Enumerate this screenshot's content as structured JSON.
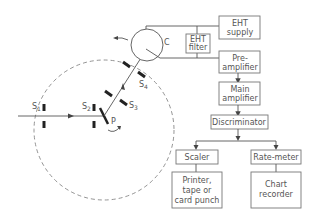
{
  "diagram": {
    "title": "",
    "colors": {
      "line": "#555555",
      "box_border": "#777777",
      "slit": "#222222",
      "circle": "#888888"
    },
    "geometry_labels": {
      "s1": "S",
      "s1_sub": "1",
      "s2": "S",
      "s2_sub": "2",
      "s3": "S",
      "s3_sub": "3",
      "s4": "S",
      "s4_sub": "4",
      "p": "P",
      "c": "C"
    },
    "boxes": {
      "eht_supply": [
        "EHT",
        "supply"
      ],
      "eht_filter": [
        "EHT",
        "filter"
      ],
      "preamp": [
        "Pre-",
        "amplifier"
      ],
      "main_amp": [
        "Main",
        "amplifier"
      ],
      "discriminator": [
        "Discriminator"
      ],
      "scaler": [
        "Scaler"
      ],
      "ratemeter": [
        "Rate-meter"
      ],
      "printer": [
        "Printer,",
        "tape or",
        "card punch"
      ],
      "chart": [
        "Chart",
        "recorder"
      ]
    }
  }
}
